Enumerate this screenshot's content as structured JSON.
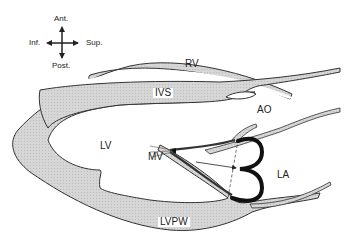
{
  "figure": {
    "type": "echocardiographic parasternal long-axis schematic",
    "colors": {
      "tissue_fill": "#d4d4d4",
      "outline": "#333333",
      "background": "#ffffff",
      "leaflet": "#111111"
    }
  },
  "orientation": {
    "top": "Ant.",
    "bottom": "Post.",
    "left": "Inf.",
    "right": "Sup."
  },
  "labels": {
    "rv": "RV",
    "ivs": "IVS",
    "ao": "AO",
    "lv": "LV",
    "mv": "MV",
    "la": "LA",
    "lvpw": "LVPW"
  }
}
